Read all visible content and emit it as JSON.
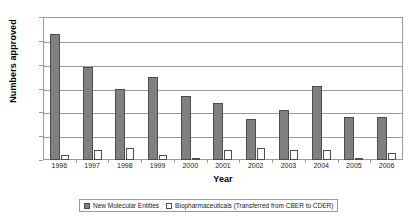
{
  "chart_data": {
    "type": "bar",
    "title": "",
    "xlabel": "Year",
    "ylabel": "Numbers approved",
    "categories": [
      "1996",
      "1997",
      "1998",
      "1999",
      "2000",
      "2001",
      "2002",
      "2003",
      "2004",
      "2005",
      "2006"
    ],
    "series": [
      {
        "name": "New Molecular Entities",
        "color": "#808080",
        "values": [
          53,
          39,
          30,
          35,
          27,
          24,
          17,
          21,
          31,
          18,
          18
        ]
      },
      {
        "name": "Biopharmaceuticals (Transferred from CBER to CDER)",
        "color": "#ffffff",
        "values": [
          2,
          4,
          5,
          2,
          1,
          4,
          5,
          4,
          4,
          1,
          3
        ]
      }
    ],
    "ylim": [
      0,
      60
    ],
    "yticks": [
      0,
      10,
      20,
      30,
      40,
      50,
      60
    ],
    "ytick_labels": [
      "0",
      "10",
      "20",
      "30",
      "40",
      "50",
      "60"
    ],
    "grid": true,
    "grid_axis": "y",
    "legend_position": "bottom"
  },
  "colors": {
    "series_nme": "#808080",
    "series_bio": "#ffffff",
    "axis": "#9a9a9a",
    "bar_outline": "#4d4d4d",
    "text": "#1a1a1a",
    "background": "#ffffff"
  }
}
